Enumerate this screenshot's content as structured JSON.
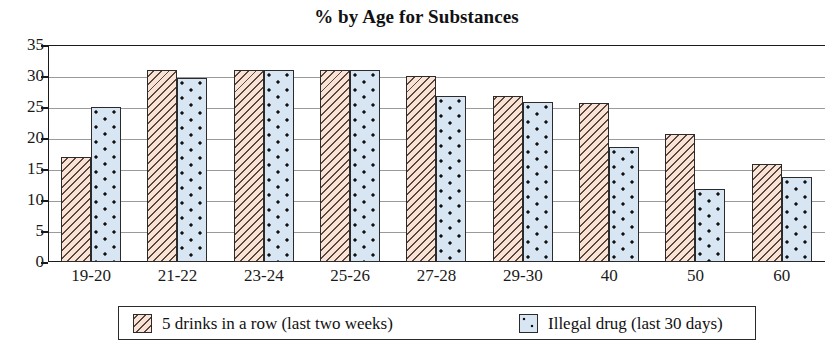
{
  "chart_data": {
    "type": "bar",
    "title": "% by Age for Substances",
    "xlabel": "",
    "ylabel": "",
    "ylim": [
      0,
      35
    ],
    "yticks": [
      0,
      5,
      10,
      15,
      20,
      25,
      30,
      35
    ],
    "ytick_labels": [
      "0",
      "5",
      "10",
      "15",
      "20",
      "25",
      "30",
      "35"
    ],
    "grid": true,
    "legend_position": "bottom",
    "categories": [
      "19-20",
      "21-22",
      "23-24",
      "25-26",
      "27-28",
      "29-30",
      "40",
      "50",
      "60"
    ],
    "series": [
      {
        "name": "5 drinks in a row (last two weeks)",
        "color": "#fae2d4",
        "pattern": "diagonal-hatch",
        "values": [
          17,
          31,
          31,
          31,
          30,
          26.8,
          25.7,
          20.7,
          15.8
        ]
      },
      {
        "name": "Illegal drug (last 30 days)",
        "color": "#d7e6f2",
        "pattern": "dots",
        "values": [
          25,
          29.7,
          31,
          31,
          26.8,
          25.8,
          18.6,
          11.8,
          13.7
        ]
      }
    ]
  },
  "legend": {
    "entries": [
      {
        "label": "5 drinks in a row (last two weeks)"
      },
      {
        "label": "Illegal drug (last 30 days)"
      }
    ]
  }
}
